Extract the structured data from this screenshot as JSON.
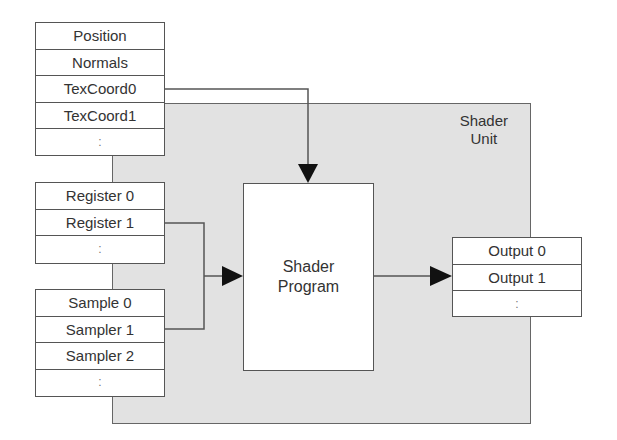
{
  "shader_unit": {
    "label_line1": "Shader",
    "label_line2": "Unit"
  },
  "shader_program": {
    "label_line1": "Shader",
    "label_line2": "Program"
  },
  "attributes": {
    "rows": [
      {
        "label": "Position"
      },
      {
        "label": "Normals"
      },
      {
        "label": "TexCoord0"
      },
      {
        "label": "TexCoord1"
      },
      {
        "label": ":"
      }
    ]
  },
  "registers": {
    "rows": [
      {
        "label": "Register 0"
      },
      {
        "label": "Register 1"
      },
      {
        "label": ":"
      }
    ]
  },
  "samplers": {
    "rows": [
      {
        "label": "Sample 0"
      },
      {
        "label": "Sampler 1"
      },
      {
        "label": "Sampler 2"
      },
      {
        "label": ":"
      }
    ]
  },
  "outputs": {
    "rows": [
      {
        "label": "Output 0"
      },
      {
        "label": "Output 1"
      },
      {
        "label": ":"
      }
    ]
  },
  "connections": [
    {
      "from": "TexCoord0",
      "to": "Shader Program (top)"
    },
    {
      "from": "Register 1",
      "to": "Shader Program (left)"
    },
    {
      "from": "Sampler 1",
      "to": "Shader Program (left)"
    },
    {
      "from": "Shader Program",
      "to": "Output 1"
    }
  ],
  "colors": {
    "unit_fill": "#e2e2e2",
    "box_fill": "#ffffff",
    "stroke": "#555555",
    "arrow": "#111111"
  }
}
